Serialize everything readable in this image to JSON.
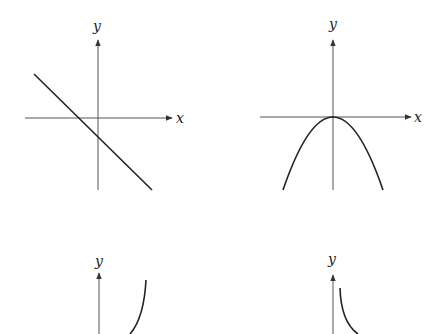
{
  "graphs": [
    {
      "id": "graph-1",
      "type": "line",
      "description": "straight line with negative slope, negative y-intercept",
      "x_label": "x",
      "y_label": "y",
      "origin": [
        98,
        118
      ],
      "curve_path": "M34,74 L152,190",
      "x_axis": {
        "from": 25,
        "to": 172
      },
      "y_axis": {
        "from": 190,
        "to": 40
      },
      "x_label_pos": [
        176,
        123
      ],
      "y_label_pos": [
        93,
        31
      ]
    },
    {
      "id": "graph-2",
      "type": "parabola",
      "description": "downward-opening parabola with vertex at origin",
      "x_label": "x",
      "y_label": "y",
      "origin": [
        333,
        117
      ],
      "curve_path": "M283,190 Q333,44 383,190",
      "x_axis": {
        "from": 260,
        "to": 411
      },
      "y_axis": {
        "from": 190,
        "to": 40
      },
      "x_label_pos": [
        414,
        122
      ],
      "y_label_pos": [
        329,
        29
      ]
    },
    {
      "id": "graph-3",
      "type": "curve",
      "description": "increasing concave-up curve (exponential-like), partially visible",
      "x_label": "",
      "y_label": "y",
      "origin": [
        99,
        334
      ],
      "curve_path": "M130,334 Q144,318 146,280",
      "x_axis": null,
      "y_axis": {
        "from": 334,
        "to": 273
      },
      "y_label_pos": [
        95,
        266
      ]
    },
    {
      "id": "graph-4",
      "type": "curve",
      "description": "decreasing concave-up curve (reciprocal/decay-like), partially visible",
      "x_label": "",
      "y_label": "y",
      "origin": [
        333,
        334
      ],
      "curve_path": "M340,288 Q341,322 358,334",
      "x_axis": null,
      "y_axis": {
        "from": 334,
        "to": 275
      },
      "y_label_pos": [
        328,
        264
      ]
    }
  ]
}
